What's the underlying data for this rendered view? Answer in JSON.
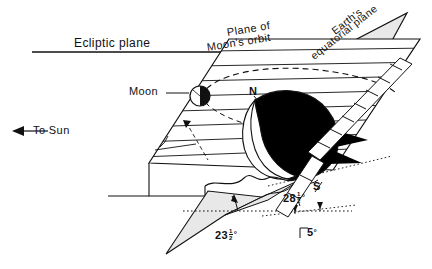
{
  "figure": {
    "type": "astronomy-diagram",
    "background_color": "#ffffff",
    "line_color": "#111111",
    "plane_fill": "#e8e8e8",
    "night_side_color": "#000000",
    "day_side_color": "#ffffff"
  },
  "labels": {
    "ecliptic_plane": "Ecliptic plane",
    "plane_of_line1": "Plane of",
    "plane_of_line2": "Moon's orbit",
    "earth_equatorial_line1": "Earth's",
    "earth_equatorial_line2": "equatorial plane",
    "moon": "Moon",
    "to_sun": "To Sun",
    "north_pole": "N",
    "south_pole": "S"
  },
  "angles": [
    {
      "name": "obliquity-of-ecliptic",
      "whole": "23",
      "num": "1",
      "den": "2",
      "unit": "°",
      "display": "23½°"
    },
    {
      "name": "max-lunar-inclination",
      "whole": "28",
      "num": "1",
      "den": "2",
      "unit": "°",
      "display": "28½°"
    },
    {
      "name": "moon-orbit-inclination",
      "whole": "5",
      "num": "",
      "den": "",
      "unit": "°",
      "display": "5°"
    }
  ],
  "icons": {
    "sun_arrow": "left-arrow-icon",
    "moon_disc": "moon-phase-icon",
    "earth_sphere": "earth-globe-icon"
  }
}
